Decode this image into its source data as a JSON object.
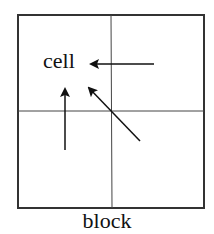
{
  "diagram": {
    "cell_label": "cell",
    "block_label": "block",
    "grid": {
      "rows": 2,
      "cols": 2
    },
    "arrows": [
      {
        "name": "arrow-from-right",
        "from": "right neighbor cell",
        "to": "cell"
      },
      {
        "name": "arrow-from-below",
        "from": "lower neighbor cell",
        "to": "cell"
      },
      {
        "name": "arrow-from-diagonal",
        "from": "lower-right diagonal cell",
        "to": "cell"
      }
    ],
    "colors": {
      "line": "#222222",
      "background": "#ffffff"
    }
  }
}
